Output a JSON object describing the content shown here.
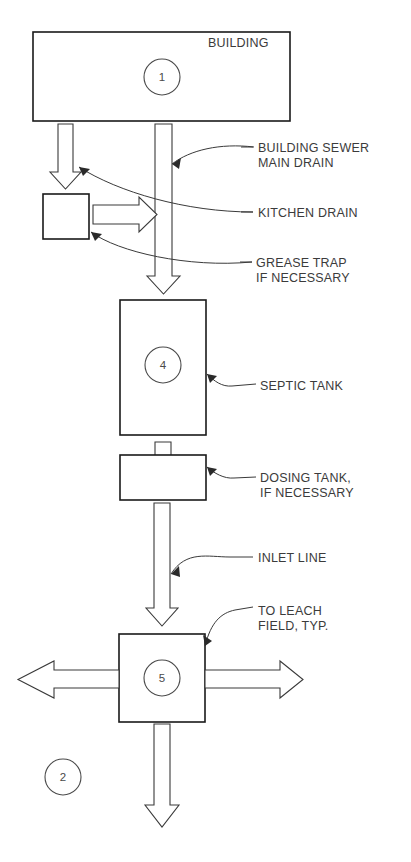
{
  "diagram": {
    "colors": {
      "background": "#ffffff",
      "box_stroke": "#1a1a1a",
      "arrow_stroke": "#3a3a3a",
      "arrow_fill": "#ffffff",
      "text": "#3b3b3b",
      "tag_stroke": "#4a4a4a"
    },
    "nodes": [
      {
        "id": "building",
        "label": "BUILDING",
        "tag": "1",
        "shape": "rectangle",
        "x": 33,
        "y": 32,
        "w": 257,
        "h": 89,
        "label_x": 208,
        "label_y": 47,
        "tag_cx": 162,
        "tag_cy": 77,
        "tag_r": 18
      },
      {
        "id": "grease-trap",
        "label": "",
        "tag": "",
        "shape": "rectangle",
        "x": 43,
        "y": 194,
        "w": 46,
        "h": 45,
        "label_x": 0,
        "label_y": 0,
        "tag_cx": 0,
        "tag_cy": 0,
        "tag_r": 0
      },
      {
        "id": "septic-tank",
        "label": "",
        "tag": "4",
        "shape": "rectangle",
        "x": 120,
        "y": 300,
        "w": 86,
        "h": 135,
        "label_x": 0,
        "label_y": 0,
        "tag_cx": 163,
        "tag_cy": 365,
        "tag_r": 18
      },
      {
        "id": "dosing-tank",
        "label": "",
        "tag": "",
        "shape": "rectangle",
        "x": 120,
        "y": 455,
        "w": 86,
        "h": 45,
        "label_x": 0,
        "label_y": 0,
        "tag_cx": 0,
        "tag_cy": 0,
        "tag_r": 0
      },
      {
        "id": "distribution-box",
        "label": "",
        "tag": "5",
        "shape": "rectangle",
        "x": 119,
        "y": 634,
        "w": 86,
        "h": 88,
        "label_x": 0,
        "label_y": 0,
        "tag_cx": 162,
        "tag_cy": 678,
        "tag_r": 18
      }
    ],
    "detail_tags": [
      {
        "id": "detail-2",
        "tag": "2",
        "cx": 63,
        "cy": 777,
        "r": 18
      }
    ],
    "callouts": [
      {
        "id": "building-sewer-main-drain",
        "lines": [
          "BUILDING SEWER",
          "MAIN DRAIN"
        ],
        "text_x": 258,
        "text_y": 152,
        "line_height": 15,
        "leader": "M 241 147 L 253 147",
        "arrow_path": "M 254 147 C 220 143 190 150 172 164",
        "head": "M 172 164 L 180 159 L 178 168 Z"
      },
      {
        "id": "kitchen-drain",
        "lines": [
          "KITCHEN DRAIN"
        ],
        "text_x": 258,
        "text_y": 217,
        "line_height": 15,
        "leader": "M 241 212 L 253 212",
        "arrow_path": "M 254 212 C 190 212 120 190 79 167",
        "head": "M 79 167 L 88 168 L 82 174 Z"
      },
      {
        "id": "grease-trap-if-necessary",
        "lines": [
          "GREASE TRAP",
          "IF NECESSARY"
        ],
        "text_x": 256,
        "text_y": 262,
        "line_height": 15,
        "leader": "M 241 257 L 252 257",
        "arrow_path": "M 253 257 C 190 262 120 250 91 232",
        "head": "M 91 232 L 100 233 L 94 239 Z"
      },
      {
        "id": "septic-tank-label",
        "lines": [
          "SEPTIC TANK"
        ],
        "text_x": 260,
        "text_y": 390,
        "line_height": 15,
        "leader": "M 231 386 L 255 383",
        "arrow_path": "M 231 386 C 222 386 214 380 206 374",
        "head": "M 206 374 L 215 375 L 209 381 Z"
      },
      {
        "id": "dosing-tank-if-necessary",
        "lines": [
          "DOSING TANK,",
          "IF NECESSARY"
        ],
        "text_x": 260,
        "text_y": 482,
        "line_height": 15,
        "leader": "M 233 478 L 255 476",
        "arrow_path": "M 233 478 C 223 478 214 473 206 468",
        "head": "M 206 468 L 215 469 L 209 475 Z"
      },
      {
        "id": "inlet-line",
        "lines": [
          "INLET LINE"
        ],
        "text_x": 258,
        "text_y": 562,
        "line_height": 15,
        "leader": "M 233 558 L 253 558",
        "arrow_path": "M 233 558 C 212 558 188 552 172 574",
        "head": "M 172 574 L 179 568 L 179 577 Z"
      },
      {
        "id": "to-leach-field-typ",
        "lines": [
          "TO LEACH",
          "FIELD, TYP."
        ],
        "text_x": 258,
        "text_y": 615,
        "line_height": 15,
        "leader": "M 236 611 L 253 608",
        "arrow_path": "M 236 611 C 222 612 212 620 205 645",
        "head": "M 205 645 L 204 636 L 211 641 Z"
      }
    ],
    "arrows": [
      {
        "id": "kitchen-drain-arrow",
        "direction": "down",
        "points": "58,124 73,124 73,172 81,172 65.5,189 50,172 58,172"
      },
      {
        "id": "main-drain-arrow",
        "direction": "down",
        "points": "155,124 172,124 172,276 180,276 163.5,294 147,276 155,276"
      },
      {
        "id": "grease-trap-outlet-arrow",
        "direction": "right",
        "points": "93,205 139,205 139,197 157,214.5 139,232 139,224 93,224"
      },
      {
        "id": "septic-inlet-arrow",
        "direction": "down",
        "points": "155,442 171,442 171,480 179,480 163,498 147,480 155,480"
      },
      {
        "id": "dosing-outlet-arrow",
        "direction": "down",
        "points": "154,503 170,503 170,608 178,608 162,626 146,608 154,608"
      },
      {
        "id": "leach-field-left-arrow",
        "direction": "left",
        "points": "119,670 54,670 54,661 18,679.5 54,698 54,688 119,688"
      },
      {
        "id": "leach-field-right-arrow",
        "direction": "right",
        "points": "205,670 280,670 280,661 303,679.5 280,698 280,688 205,688"
      },
      {
        "id": "leach-field-down-arrow",
        "direction": "down",
        "points": "154,724 170,724 170,805 179,805 162,827 145,805 154,805"
      }
    ]
  }
}
